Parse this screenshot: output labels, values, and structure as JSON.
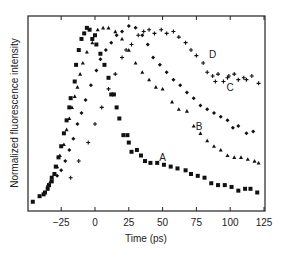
{
  "chart_data": {
    "type": "scatter",
    "title": "",
    "xlabel": "Time (ps)",
    "ylabel": "Normalized fluorescence intensity",
    "xlim": [
      -50,
      125
    ],
    "ylim": [
      0,
      1.05
    ],
    "grid": false,
    "legend": "none (inline curve labels A, B, C, D)",
    "x_ticks": [
      -25,
      0,
      25,
      50,
      75,
      100,
      125
    ],
    "x_tick_labels": [
      "−25",
      "0",
      "25",
      "50",
      "75",
      "100",
      "125"
    ],
    "y_ticks": [],
    "series": [
      {
        "name": "A",
        "marker": "square",
        "label_pos": [
          50,
          0.29
        ],
        "points": [
          [
            -46,
            0.05
          ],
          [
            -41,
            0.08
          ],
          [
            -38,
            0.09
          ],
          [
            -37,
            0.1
          ],
          [
            -35,
            0.12
          ],
          [
            -34,
            0.14
          ],
          [
            -32,
            0.16
          ],
          [
            -32,
            0.18
          ],
          [
            -30,
            0.2
          ],
          [
            -29,
            0.24
          ],
          [
            -27,
            0.29
          ],
          [
            -25,
            0.35
          ],
          [
            -23,
            0.42
          ],
          [
            -21,
            0.49
          ],
          [
            -19,
            0.56
          ],
          [
            -18,
            0.61
          ],
          [
            -15,
            0.7
          ],
          [
            -14,
            0.79
          ],
          [
            -12,
            0.87
          ],
          [
            -10,
            0.93
          ],
          [
            -8,
            0.96
          ],
          [
            -6,
            0.99
          ],
          [
            -4,
            0.98
          ],
          [
            -2,
            0.93
          ],
          [
            0,
            0.95
          ],
          [
            1,
            0.9
          ],
          [
            4,
            0.85
          ],
          [
            7,
            0.79
          ],
          [
            10,
            0.72
          ],
          [
            12,
            0.63
          ],
          [
            14,
            0.63
          ],
          [
            16,
            0.56
          ],
          [
            18,
            0.5
          ],
          [
            21,
            0.41
          ],
          [
            24,
            0.41
          ],
          [
            25,
            0.37
          ],
          [
            27,
            0.32
          ],
          [
            31,
            0.33
          ],
          [
            34,
            0.3
          ],
          [
            37,
            0.27
          ],
          [
            41,
            0.26
          ],
          [
            46,
            0.26
          ],
          [
            51,
            0.25
          ],
          [
            56,
            0.24
          ],
          [
            61,
            0.23
          ],
          [
            67,
            0.22
          ],
          [
            71,
            0.2
          ],
          [
            76,
            0.19
          ],
          [
            81,
            0.18
          ],
          [
            86,
            0.15
          ],
          [
            91,
            0.14
          ],
          [
            96,
            0.14
          ],
          [
            101,
            0.13
          ],
          [
            106,
            0.11
          ],
          [
            111,
            0.12
          ],
          [
            115,
            0.12
          ],
          [
            120,
            0.1
          ]
        ]
      },
      {
        "name": "B",
        "marker": "triangle",
        "label_pos": [
          77,
          0.46
        ],
        "points": [
          [
            -35,
            0.14
          ],
          [
            -33,
            0.16
          ],
          [
            -30,
            0.2
          ],
          [
            -28,
            0.24
          ],
          [
            -26,
            0.3
          ],
          [
            -23,
            0.36
          ],
          [
            -21,
            0.44
          ],
          [
            -19,
            0.5
          ],
          [
            -17,
            0.56
          ],
          [
            -15,
            0.62
          ],
          [
            -13,
            0.67
          ],
          [
            -11,
            0.74
          ],
          [
            -9,
            0.8
          ],
          [
            -6,
            0.86
          ],
          [
            -2,
            0.91
          ],
          [
            2,
            0.98
          ],
          [
            6,
            0.99
          ],
          [
            10,
            0.99
          ],
          [
            15,
            0.97
          ],
          [
            20,
            0.93
          ],
          [
            25,
            0.87
          ],
          [
            30,
            0.8
          ],
          [
            35,
            0.75
          ],
          [
            40,
            0.71
          ],
          [
            45,
            0.67
          ],
          [
            50,
            0.66
          ],
          [
            57,
            0.59
          ],
          [
            62,
            0.55
          ],
          [
            68,
            0.54
          ],
          [
            73,
            0.46
          ],
          [
            78,
            0.42
          ],
          [
            83,
            0.38
          ],
          [
            88,
            0.35
          ],
          [
            93,
            0.33
          ],
          [
            98,
            0.3
          ],
          [
            103,
            0.29
          ],
          [
            108,
            0.29
          ],
          [
            113,
            0.28
          ],
          [
            118,
            0.27
          ],
          [
            121,
            0.26
          ]
        ]
      },
      {
        "name": "C",
        "marker": "diamond",
        "label_pos": [
          100,
          0.67
        ],
        "points": [
          [
            -28,
            0.19
          ],
          [
            -25,
            0.22
          ],
          [
            -22,
            0.27
          ],
          [
            -19,
            0.33
          ],
          [
            -16,
            0.39
          ],
          [
            -13,
            0.47
          ],
          [
            -10,
            0.53
          ],
          [
            -7,
            0.6
          ],
          [
            -3,
            0.68
          ],
          [
            1,
            0.76
          ],
          [
            4,
            0.82
          ],
          [
            8,
            0.87
          ],
          [
            12,
            0.91
          ],
          [
            16,
            0.95
          ],
          [
            20,
            0.97
          ],
          [
            25,
            1.0
          ],
          [
            30,
            0.99
          ],
          [
            35,
            0.95
          ],
          [
            39,
            0.9
          ],
          [
            43,
            0.83
          ],
          [
            48,
            0.79
          ],
          [
            53,
            0.75
          ],
          [
            58,
            0.71
          ],
          [
            63,
            0.68
          ],
          [
            68,
            0.64
          ],
          [
            73,
            0.61
          ],
          [
            78,
            0.57
          ],
          [
            83,
            0.55
          ],
          [
            88,
            0.53
          ],
          [
            93,
            0.51
          ],
          [
            98,
            0.49
          ],
          [
            102,
            0.45
          ],
          [
            106,
            0.46
          ],
          [
            112,
            0.42
          ],
          [
            117,
            0.43
          ]
        ]
      },
      {
        "name": "D",
        "marker": "plus",
        "label_pos": [
          87,
          0.85
        ],
        "points": [
          [
            -18,
            0.18
          ],
          [
            -12,
            0.27
          ],
          [
            -5,
            0.37
          ],
          [
            0,
            0.47
          ],
          [
            5,
            0.56
          ],
          [
            10,
            0.66
          ],
          [
            15,
            0.74
          ],
          [
            20,
            0.83
          ],
          [
            23,
            0.87
          ],
          [
            27,
            0.9
          ],
          [
            32,
            0.95
          ],
          [
            36,
            0.97
          ],
          [
            40,
            0.98
          ],
          [
            44,
            0.96
          ],
          [
            49,
            0.98
          ],
          [
            53,
            0.96
          ],
          [
            58,
            0.97
          ],
          [
            62,
            0.94
          ],
          [
            67,
            0.91
          ],
          [
            71,
            0.87
          ],
          [
            75,
            0.84
          ],
          [
            80,
            0.8
          ],
          [
            83,
            0.75
          ],
          [
            87,
            0.73
          ],
          [
            89,
            0.7
          ],
          [
            91,
            0.74
          ],
          [
            95,
            0.7
          ],
          [
            98,
            0.72
          ],
          [
            99,
            0.73
          ],
          [
            103,
            0.74
          ],
          [
            106,
            0.71
          ],
          [
            110,
            0.72
          ],
          [
            112,
            0.71
          ],
          [
            116,
            0.73
          ],
          [
            121,
            0.69
          ]
        ]
      }
    ]
  }
}
